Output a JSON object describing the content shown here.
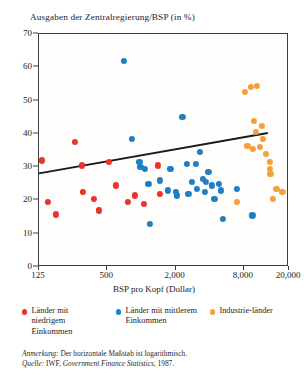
{
  "chart_data": {
    "type": "scatter",
    "title": "Ausgaben der Zentralregierung/BSP (in %)",
    "xlabel": "BSP pro Kopf (Dollar)",
    "ylabel": "Ausgaben der Zentralregierung/BSP (in %)",
    "xscale": "log",
    "xlim": [
      125,
      20000
    ],
    "ylim": [
      0,
      70
    ],
    "xticks": [
      125,
      500,
      2000,
      8000,
      20000
    ],
    "xticklabels": [
      "125",
      "500",
      "2,000",
      "8,000",
      "20,000"
    ],
    "yticks": [
      0,
      10,
      20,
      30,
      40,
      50,
      60,
      70
    ],
    "yticklabels": [
      "0",
      "10",
      "20",
      "30",
      "40",
      "50",
      "60",
      "70"
    ],
    "grid": false,
    "legend_position": "below",
    "series": [
      {
        "name": "Länder mit niedrigem Einkommen",
        "color": "#e8342b",
        "points": [
          [
            132,
            32.0
          ],
          [
            150,
            19.5
          ],
          [
            176,
            15.8
          ],
          [
            258,
            37.5
          ],
          [
            300,
            30.5
          ],
          [
            305,
            22.5
          ],
          [
            380,
            20.5
          ],
          [
            420,
            17.0
          ],
          [
            520,
            31.5
          ],
          [
            600,
            24.5
          ],
          [
            760,
            19.5
          ],
          [
            880,
            21.5
          ],
          [
            1050,
            19.0
          ],
          [
            1400,
            30.5
          ],
          [
            1450,
            22.0
          ]
        ]
      },
      {
        "name": "Länder mit mittlerem Einkommen",
        "color": "#1f7fc4",
        "points": [
          [
            700,
            62.0
          ],
          [
            820,
            38.5
          ],
          [
            960,
            31.5
          ],
          [
            980,
            30.0
          ],
          [
            1080,
            29.5
          ],
          [
            1150,
            25.0
          ],
          [
            1180,
            13.0
          ],
          [
            1450,
            26.0
          ],
          [
            1700,
            23.0
          ],
          [
            1800,
            29.5
          ],
          [
            2000,
            22.5
          ],
          [
            2050,
            21.5
          ],
          [
            2300,
            45.0
          ],
          [
            2500,
            31.0
          ],
          [
            2600,
            22.0
          ],
          [
            2800,
            25.5
          ],
          [
            3000,
            31.0
          ],
          [
            3100,
            23.5
          ],
          [
            3300,
            34.5
          ],
          [
            3500,
            26.5
          ],
          [
            3600,
            22.5
          ],
          [
            3700,
            25.5
          ],
          [
            3900,
            28.5
          ],
          [
            4200,
            24.5
          ],
          [
            4400,
            20.5
          ],
          [
            4800,
            25.0
          ],
          [
            5000,
            23.0
          ],
          [
            5200,
            14.5
          ],
          [
            7000,
            23.5
          ],
          [
            9500,
            15.5
          ]
        ]
      },
      {
        "name": "Industrieländer",
        "color": "#f2a13c",
        "points": [
          [
            8200,
            52.5
          ],
          [
            9200,
            54.0
          ],
          [
            10500,
            54.5
          ],
          [
            9800,
            44.0
          ],
          [
            10200,
            40.5
          ],
          [
            11500,
            42.5
          ],
          [
            11800,
            38.5
          ],
          [
            8600,
            36.5
          ],
          [
            9600,
            35.5
          ],
          [
            11000,
            36.0
          ],
          [
            12500,
            34.0
          ],
          [
            13500,
            31.5
          ],
          [
            13600,
            29.5
          ],
          [
            13700,
            28.0
          ],
          [
            15500,
            23.5
          ],
          [
            17500,
            22.5
          ],
          [
            14500,
            20.5
          ],
          [
            7000,
            19.5
          ]
        ]
      }
    ],
    "trendline": {
      "label": "Regressionsgerade",
      "x_start": 125,
      "y_start": 27.8,
      "x_end": 13500,
      "y_end": 40.0
    }
  },
  "legend": {
    "items": [
      {
        "label": "Länder mit niedrigem Einkommen",
        "color": "#e8342b"
      },
      {
        "label": "Länder mit mittlerem Einkommen",
        "color": "#1f7fc4"
      },
      {
        "label": "Industrie-länder",
        "color": "#f2a13c"
      }
    ]
  },
  "notes": {
    "annotation_prefix": "Anmerkung:",
    "annotation_text": " Der horizontale Maßstab ist logarithmisch.",
    "source_prefix": "Quelle:",
    "source_text_a": " IWF, ",
    "source_text_b": "Government Finance Statistics",
    "source_text_c": ", 1987."
  }
}
